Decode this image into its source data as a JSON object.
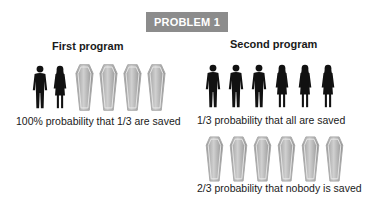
{
  "badge": {
    "label": "PROBLEM 1",
    "color": "#8c8c8c"
  },
  "first_program": {
    "title": "First program",
    "icons": [
      "man",
      "woman",
      "coffin",
      "coffin",
      "coffin",
      "coffin"
    ],
    "caption": "100% probability that 1/3 are saved"
  },
  "second_program": {
    "title": "Second program",
    "saved_row": {
      "icons": [
        "man",
        "man",
        "man",
        "woman",
        "woman",
        "woman"
      ],
      "caption": "1/3 probability that all are saved"
    },
    "dead_row": {
      "icons": [
        "coffin",
        "coffin",
        "coffin",
        "coffin",
        "coffin",
        "coffin"
      ],
      "caption": "2/3 probability that nobody is saved"
    }
  }
}
